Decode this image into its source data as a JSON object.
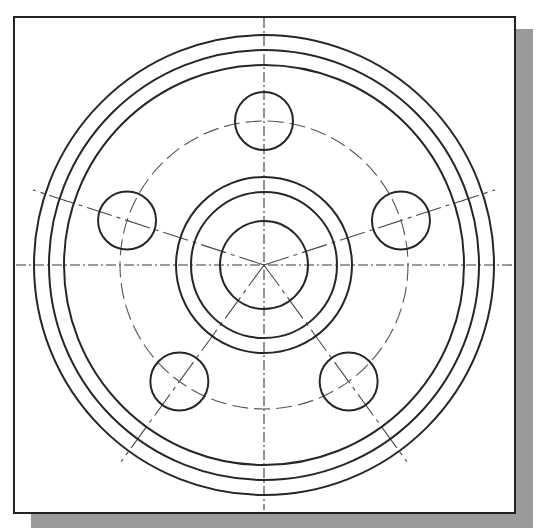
{
  "drawing": {
    "title": "",
    "type": "flange-plate-drawing",
    "colors": {
      "line": "#262626",
      "centerline": "#4a4a4a",
      "shadow": "#9a9a9a",
      "background": "#ffffff"
    },
    "center": {
      "x": 264,
      "y": 265
    },
    "outer_rings_radii": [
      200,
      215,
      230
    ],
    "hub_rings_radii": [
      44,
      73,
      88
    ],
    "bolt_circle_radius": 144,
    "bolt_holes": {
      "count": 5,
      "radius": 29,
      "angles_deg": [
        90,
        162,
        234,
        306,
        18
      ]
    },
    "centerline_length": 243
  }
}
